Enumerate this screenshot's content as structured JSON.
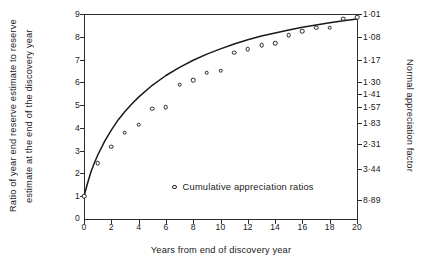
{
  "chart_data": {
    "type": "scatter",
    "title": "",
    "xlabel": "Years from end of discovery year",
    "ylabel_line1": "Ratio of year end reserve estimate to reserve",
    "ylabel_line2": "estimate at the end of the discovery year",
    "y2label": "Normal appreciation factor",
    "xlim": [
      0,
      20
    ],
    "ylim": [
      0,
      9
    ],
    "grid": false,
    "legend_position": "inside-bottom-center",
    "legend": [
      {
        "label": "Cumulative appreciation ratios",
        "marker": "open-circle"
      }
    ],
    "xticks": [
      0,
      2,
      4,
      6,
      8,
      10,
      12,
      14,
      16,
      18,
      20
    ],
    "xticklabels": [
      "0",
      "2",
      "4",
      "6",
      "8",
      "10",
      "12",
      "14",
      "16",
      "18",
      "20"
    ],
    "yticks": [
      1,
      2,
      3,
      4,
      5,
      6,
      7,
      8,
      9
    ],
    "yticklabels": [
      "1",
      "2",
      "3",
      "4",
      "5",
      "6",
      "7",
      "8",
      "9"
    ],
    "y_origin_label": "0",
    "y2_ticks": [
      {
        "y": 9.0,
        "label": "1·01"
      },
      {
        "y": 8.0,
        "label": "1·08"
      },
      {
        "y": 7.0,
        "label": "1·17"
      },
      {
        "y": 6.0,
        "label": "1·30"
      },
      {
        "y": 5.5,
        "label": "1·41"
      },
      {
        "y": 4.9,
        "label": "1·57"
      },
      {
        "y": 4.2,
        "label": "1·83"
      },
      {
        "y": 3.3,
        "label": "2·31"
      },
      {
        "y": 2.2,
        "label": "3·44"
      },
      {
        "y": 0.85,
        "label": "8·89"
      }
    ],
    "series": [
      {
        "name": "Cumulative appreciation ratios",
        "marker": "open-circle",
        "x": [
          0,
          1,
          2,
          3,
          4,
          5,
          6,
          7,
          8,
          9,
          10,
          11,
          12,
          13,
          14,
          15,
          16,
          17,
          18,
          19,
          20
        ],
        "values": [
          1.0,
          2.45,
          3.17,
          3.78,
          4.13,
          4.84,
          4.9,
          5.9,
          6.1,
          6.42,
          6.5,
          7.3,
          7.45,
          7.62,
          7.72,
          8.08,
          8.25,
          8.4,
          8.4,
          8.8,
          8.85
        ]
      },
      {
        "name": "fitted curve",
        "type": "line",
        "x": [
          0,
          0.25,
          0.5,
          0.75,
          1,
          1.5,
          2,
          2.5,
          3,
          3.5,
          4,
          5,
          6,
          7,
          8,
          9,
          10,
          11,
          12,
          13,
          14,
          15,
          16,
          17,
          18,
          19,
          20
        ],
        "values": [
          1.0,
          1.55,
          2.05,
          2.45,
          2.8,
          3.4,
          3.9,
          4.35,
          4.72,
          5.05,
          5.35,
          5.87,
          6.3,
          6.66,
          6.97,
          7.24,
          7.47,
          7.68,
          7.87,
          8.03,
          8.17,
          8.3,
          8.42,
          8.52,
          8.62,
          8.7,
          8.78
        ]
      }
    ]
  }
}
